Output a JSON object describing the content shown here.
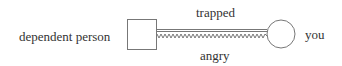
{
  "diagram": {
    "left_node": {
      "label": "dependent person",
      "shape": "square"
    },
    "right_node": {
      "label": "you",
      "shape": "circle"
    },
    "connections": [
      {
        "label": "trapped",
        "style": "double-line",
        "position": "above"
      },
      {
        "label": "angry",
        "style": "zigzag",
        "position": "below"
      }
    ]
  }
}
